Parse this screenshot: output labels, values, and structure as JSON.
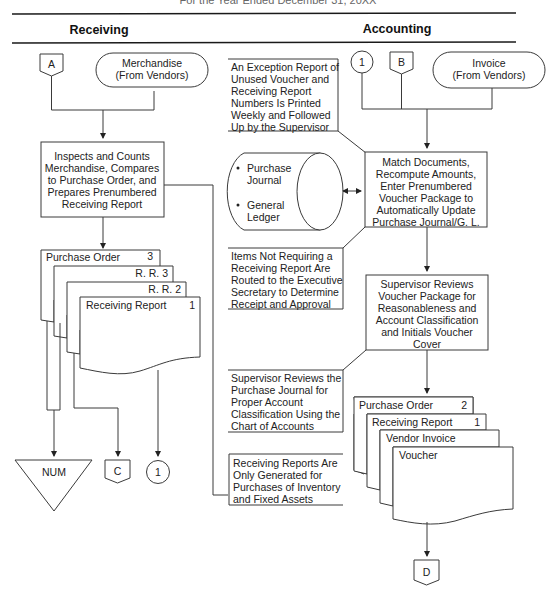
{
  "title_partial": "For the Year Ended December 31, 20XX",
  "columns": {
    "receiving": "Receiving",
    "accounting": "Accounting"
  },
  "receiving": {
    "connector_a": "A",
    "merchandise_terminal": [
      "Merchandise",
      "(From Vendors)"
    ],
    "inspect_process": [
      "Inspects and Counts",
      "Merchandise, Compares",
      "to Purchase Order, and",
      "Prepares Prenumbered",
      "Receiving Report"
    ],
    "documents": {
      "purchase_order": "Purchase Order",
      "purchase_order_copy": "3",
      "rr3": "R. R. 3",
      "rr2": "R. R. 2",
      "receiving_report": "Receiving Report",
      "receiving_report_copy": "1"
    },
    "file_num": "NUM",
    "connector_c": "C",
    "connector_1": "1"
  },
  "accounting": {
    "connector_1": "1",
    "connector_b": "B",
    "invoice_terminal": [
      "Invoice",
      "(From Vendors)"
    ],
    "annotation_exception": [
      "An Exception Report of",
      "Unused Voucher and",
      "Receiving Report",
      "Numbers Is Printed",
      "Weekly and Followed",
      "Up by the Supervisor"
    ],
    "disk": {
      "item1": [
        "Purchase",
        "Journal"
      ],
      "item2": [
        "General",
        "Ledger"
      ]
    },
    "match_process": [
      "Match Documents,",
      "Recompute Amounts,",
      "Enter Prenumbered",
      "Voucher Package to",
      "Automatically Update",
      "Purchase Journal/G. L."
    ],
    "annotation_items": [
      "Items Not Requiring a",
      "Receiving Report Are",
      "Routed to the Executive",
      "Secretary to Determine",
      "Receipt and Approval"
    ],
    "review_process": [
      "Supervisor Reviews",
      "Voucher Package for",
      "Reasonableness and",
      "Account Classification",
      "and Initials Voucher",
      "Cover"
    ],
    "annotation_supervisor": [
      "Supervisor Reviews the",
      "Purchase Journal for",
      "Proper Account",
      "Classification Using the",
      "Chart of Accounts"
    ],
    "annotation_rr": [
      "Receiving Reports Are",
      "Only Generated for",
      "Purchases of Inventory",
      "and Fixed Assets"
    ],
    "documents": {
      "purchase_order": "Purchase Order",
      "purchase_order_copy": "2",
      "receiving_report": "Receiving Report",
      "receiving_report_copy": "1",
      "vendor_invoice": "Vendor Invoice",
      "voucher": "Voucher"
    },
    "connector_d": "D"
  }
}
